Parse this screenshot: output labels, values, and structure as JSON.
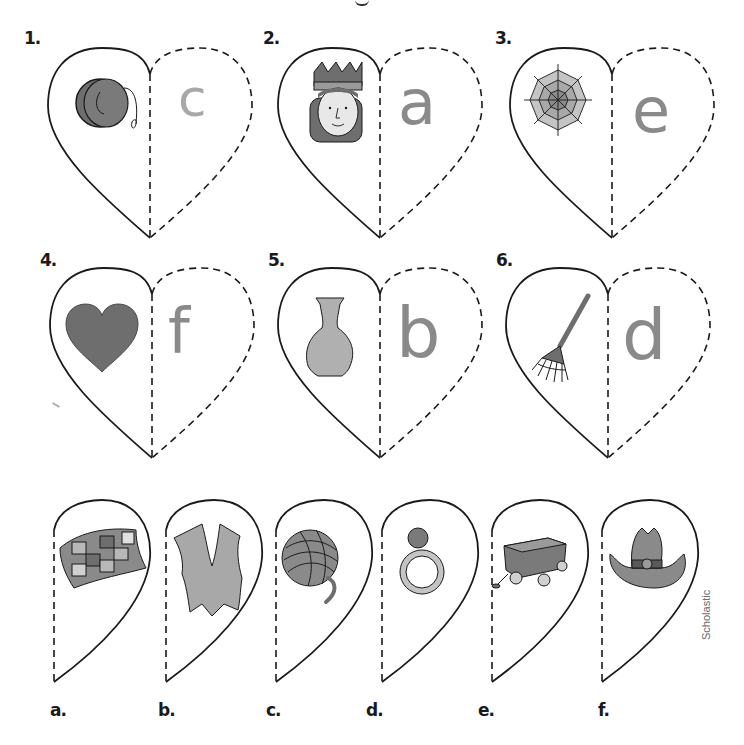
{
  "worksheet": {
    "top_row": [
      {
        "number": "1.",
        "picture": "yo-yo",
        "answer": "c"
      },
      {
        "number": "2.",
        "picture": "queen",
        "answer": "a"
      },
      {
        "number": "3.",
        "picture": "web",
        "answer": "e"
      }
    ],
    "middle_row": [
      {
        "number": "4.",
        "picture": "heart",
        "answer": "f"
      },
      {
        "number": "5.",
        "picture": "vase",
        "answer": "b"
      },
      {
        "number": "6.",
        "picture": "rake",
        "answer": "d"
      }
    ],
    "cutouts": [
      {
        "label": "a.",
        "picture": "quilt"
      },
      {
        "label": "b.",
        "picture": "vest"
      },
      {
        "label": "c.",
        "picture": "yarn"
      },
      {
        "label": "d.",
        "picture": "ring"
      },
      {
        "label": "e.",
        "picture": "wagon"
      },
      {
        "label": "f.",
        "picture": "hat"
      }
    ],
    "credit": "Scholastic"
  },
  "colors": {
    "line": "#1a1a1a",
    "fill_dark": "#6e6e6e",
    "fill_mid": "#9a9a9a",
    "fill_light": "#c4c4c4",
    "pencil": "#8a8a8a"
  }
}
